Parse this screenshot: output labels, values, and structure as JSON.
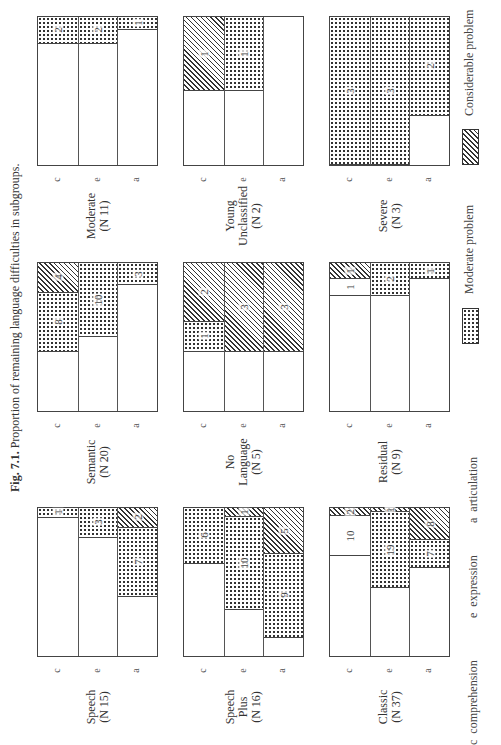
{
  "figure": {
    "label": "Fig. 7.1.",
    "caption": "Proportion of remaining language difficulties in subgroups."
  },
  "axis_codes": [
    "c",
    "e",
    "a"
  ],
  "key": {
    "c": "comprehension",
    "e": "expression",
    "a": "articulation"
  },
  "legend": {
    "moderate": "Moderate problem",
    "considerable": "Considerable problem"
  },
  "chart_data": {
    "type": "bar",
    "subtype": "stacked proportional bars (100% = N), small multiples",
    "title": "Fig. 7.1. Proportion of remaining language difficulties in subgroups.",
    "orientation_note": "page rotated 90°; bars grow from the panel's top edge",
    "categories": [
      "c",
      "e",
      "a"
    ],
    "category_labels": [
      "comprehension",
      "expression",
      "articulation"
    ],
    "legend": [
      "Moderate problem",
      "Considerable problem"
    ],
    "panels": [
      {
        "name": "Moderate",
        "line1": "Moderate",
        "line2": "",
        "n_label": "(N 11)",
        "N": 11,
        "col": 0,
        "row": 0,
        "bars": {
          "c": [
            {
              "type": "mod",
              "value": 2
            }
          ],
          "e": [
            {
              "type": "mod",
              "value": 2
            }
          ],
          "a": [
            {
              "type": "mod",
              "value": 1
            }
          ]
        }
      },
      {
        "name": "Semantic",
        "line1": "Semantic",
        "line2": "",
        "n_label": "(N 20)",
        "N": 20,
        "col": 0,
        "row": 1,
        "bars": {
          "c": [
            {
              "type": "cons",
              "value": 4
            },
            {
              "type": "mod",
              "value": 8
            }
          ],
          "e": [
            {
              "type": "mod",
              "value": 10
            }
          ],
          "a": [
            {
              "type": "mod",
              "value": 3
            }
          ]
        }
      },
      {
        "name": "Speech",
        "line1": "Speech",
        "line2": "",
        "n_label": "(N 15)",
        "N": 15,
        "col": 0,
        "row": 2,
        "bars": {
          "c": [
            {
              "type": "mod",
              "value": 1
            }
          ],
          "e": [
            {
              "type": "mod",
              "value": 3
            }
          ],
          "a": [
            {
              "type": "cons",
              "value": 2
            },
            {
              "type": "mod",
              "value": 7
            }
          ]
        }
      },
      {
        "name": "Young Unclassified",
        "line1": "Young",
        "line2": "Unclassified",
        "n_label": "(N 2)",
        "N": 2,
        "col": 1,
        "row": 0,
        "bars": {
          "c": [
            {
              "type": "cons",
              "value": 1
            }
          ],
          "e": [
            {
              "type": "mod",
              "value": 1
            }
          ],
          "a": []
        }
      },
      {
        "name": "No Language",
        "line1": "No",
        "line2": "Language",
        "n_label": "(N 5)",
        "N": 5,
        "col": 1,
        "row": 1,
        "bars": {
          "c": [
            {
              "type": "cons",
              "value": 2
            },
            {
              "type": "mod",
              "value": 1
            }
          ],
          "e": [
            {
              "type": "cons",
              "value": 3
            }
          ],
          "a": [
            {
              "type": "cons",
              "value": 3
            }
          ]
        }
      },
      {
        "name": "Speech Plus",
        "line1": "Speech",
        "line2": "Plus",
        "n_label": "(N 16)",
        "N": 16,
        "col": 1,
        "row": 2,
        "bars": {
          "c": [
            {
              "type": "mod",
              "value": 6
            }
          ],
          "e": [
            {
              "type": "cons",
              "value": 1
            },
            {
              "type": "mod",
              "value": 10
            }
          ],
          "a": [
            {
              "type": "cons",
              "value": 5
            },
            {
              "type": "mod",
              "value": 9
            }
          ]
        }
      },
      {
        "name": "Severe",
        "line1": "Severe",
        "line2": "",
        "n_label": "(N 3)",
        "N": 3,
        "col": 2,
        "row": 0,
        "bars": {
          "c": [
            {
              "type": "mod",
              "value": 3
            }
          ],
          "e": [
            {
              "type": "mod",
              "value": 3
            }
          ],
          "a": [
            {
              "type": "mod",
              "value": 2
            }
          ]
        }
      },
      {
        "name": "Residual",
        "line1": "Residual",
        "line2": "",
        "n_label": "(N 9)",
        "N": 9,
        "col": 2,
        "row": 1,
        "bars": {
          "c": [
            {
              "type": "cons",
              "value": 1
            },
            {
              "type": "blank",
              "value": 1
            }
          ],
          "e": [
            {
              "type": "mod",
              "value": 2
            }
          ],
          "a": [
            {
              "type": "mod",
              "value": 1
            }
          ]
        }
      },
      {
        "name": "Classic",
        "line1": "Classic",
        "line2": "",
        "n_label": "(N 37)",
        "N": 37,
        "col": 2,
        "row": 2,
        "bars": {
          "c": [
            {
              "type": "cons",
              "value": 2
            },
            {
              "type": "blank",
              "value": 10
            }
          ],
          "e": [
            {
              "type": "cons",
              "value": 1
            },
            {
              "type": "mod",
              "value": 19
            }
          ],
          "a": [
            {
              "type": "cons",
              "value": 8
            },
            {
              "type": "mod",
              "value": 7
            }
          ]
        }
      }
    ]
  }
}
